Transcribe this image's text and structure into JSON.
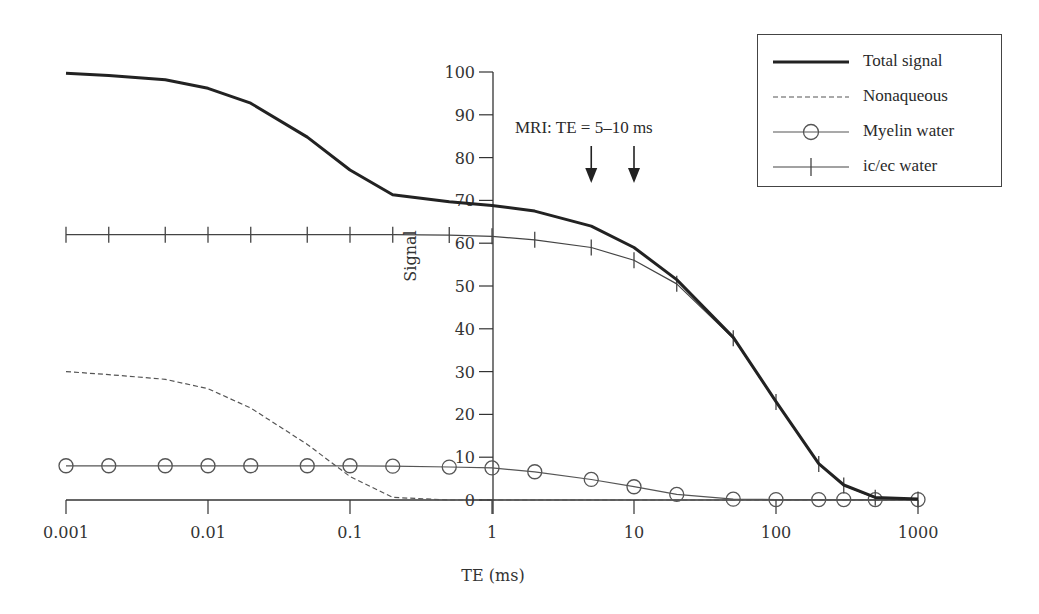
{
  "chart_data": {
    "type": "line",
    "title": "",
    "xlabel": "TE (ms)",
    "ylabel": "Signal",
    "xscale": "log",
    "xlim": [
      0.001,
      1000
    ],
    "ylim": [
      0,
      100
    ],
    "x_ticks": [
      0.001,
      0.01,
      0.1,
      1,
      10,
      100,
      1000
    ],
    "x_tick_labels": [
      "0.001",
      "0.01",
      "0.1",
      "1",
      "10",
      "100",
      "1000"
    ],
    "y_ticks": [
      0,
      10,
      20,
      30,
      40,
      50,
      60,
      70,
      80,
      90,
      100
    ],
    "y_tick_labels": [
      "0",
      "10",
      "20",
      "30",
      "40",
      "50",
      "60",
      "70",
      "80",
      "90",
      "100"
    ],
    "grid": false,
    "legend_position": "upper right",
    "x": [
      0.001,
      0.002,
      0.005,
      0.01,
      0.02,
      0.05,
      0.1,
      0.2,
      0.5,
      1,
      2,
      5,
      10,
      20,
      50,
      100,
      200,
      300,
      500,
      1000
    ],
    "series": [
      {
        "name": "Total signal",
        "style": "thick-solid",
        "values": [
          99.7,
          99.2,
          98.2,
          96.2,
          92.7,
          84.8,
          77.1,
          71.3,
          69.7,
          68.8,
          67.5,
          64.0,
          59.0,
          51.5,
          38.0,
          23.0,
          8.5,
          3.5,
          0.6,
          0.2
        ]
      },
      {
        "name": "Nonaqueous",
        "style": "dashed",
        "values": [
          30.0,
          29.3,
          28.2,
          26.0,
          21.5,
          13.0,
          5.5,
          0.6,
          0.0,
          0.0,
          0.0,
          0.0,
          0.0,
          0.0,
          0.0,
          0.0,
          0.0,
          0.0,
          0.0,
          0.0
        ]
      },
      {
        "name": "Myelin water",
        "style": "solid-circle",
        "values": [
          8.0,
          8.0,
          8.0,
          8.0,
          8.0,
          8.0,
          8.0,
          7.9,
          7.7,
          7.5,
          6.6,
          4.8,
          3.1,
          1.3,
          0.2,
          0.1,
          0.1,
          0.1,
          0.1,
          0.1
        ]
      },
      {
        "name": "ic/ec water",
        "style": "solid-plus",
        "values": [
          62.0,
          62.0,
          62.0,
          62.0,
          62.0,
          62.0,
          62.0,
          62.0,
          61.9,
          61.6,
          60.8,
          59.0,
          56.0,
          50.5,
          37.8,
          22.9,
          8.4,
          3.4,
          0.5,
          0.1
        ]
      }
    ],
    "annotations": [
      {
        "text": "MRI: TE = 5–10 ms",
        "arrows_at_x": [
          5,
          10
        ]
      }
    ]
  },
  "legend": {
    "items": [
      {
        "label": "Total signal",
        "swatch": "thick-solid"
      },
      {
        "label": "Nonaqueous",
        "swatch": "dashed"
      },
      {
        "label": "Myelin water",
        "swatch": "solid-circle"
      },
      {
        "label": "ic/ec water",
        "swatch": "solid-plus"
      }
    ]
  },
  "annotation": {
    "text": "MRI: TE = 5–10 ms"
  },
  "axes": {
    "xlabel": "TE (ms)",
    "ylabel": "Signal"
  },
  "colors": {
    "total": "#222222",
    "nonaqueous": "#555555",
    "myelin": "#555555",
    "icec": "#444444",
    "axis": "#333333"
  }
}
